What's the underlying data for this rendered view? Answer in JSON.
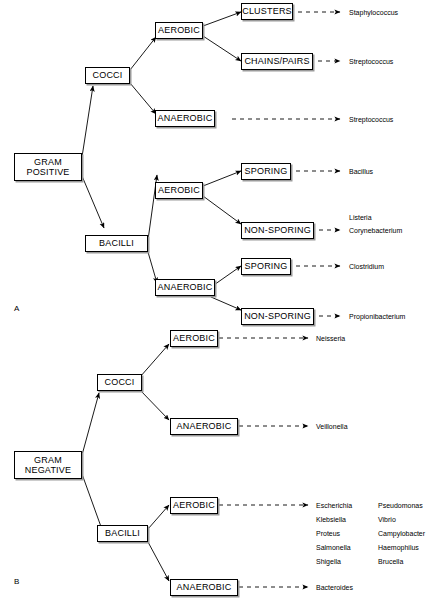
{
  "figure": {
    "panels": [
      {
        "id": "A",
        "label": "A",
        "root": "GRAM\nPOSITIVE"
      },
      {
        "id": "B",
        "label": "B",
        "root": "GRAM\nNEGATIVE"
      }
    ]
  },
  "panel_a": {
    "root_label": "GRAM\nPOSITIVE",
    "cocci_label": "COCCI",
    "bacilli_label": "BACILLI",
    "cocci_aerobic": "AEROBIC",
    "cocci_anaerobic": "ANAEROBIC",
    "clusters": "CLUSTERS",
    "chains_pairs": "CHAINS/PAIRS",
    "bacilli_aerobic": "AEROBIC",
    "bacilli_anaerobic": "ANAEROBIC",
    "aerobic_sporing": "SPORING",
    "aerobic_non_sporing": "NON-SPORING",
    "anaerobic_sporing": "SPORING",
    "anaerobic_non_sporing": "NON-SPORING",
    "organisms": {
      "clusters": "Staphylococcus",
      "chains_pairs": "Streptococcus",
      "cocci_anaerobic": "Streptococcus",
      "aerobic_sporing": "Bacillus",
      "aerobic_non_sporing_1": "Listeria",
      "aerobic_non_sporing_2": "Corynebacterium",
      "anaerobic_sporing": "Clostridium",
      "anaerobic_non_sporing": "Propionibacterium"
    }
  },
  "panel_b": {
    "root_label": "GRAM\nNEGATIVE",
    "cocci_label": "COCCI",
    "bacilli_label": "BACILLI",
    "cocci_aerobic": "AEROBIC",
    "cocci_anaerobic": "ANAEROBIC",
    "bacilli_aerobic": "AEROBIC",
    "bacilli_anaerobic": "ANAEROBIC",
    "organisms": {
      "cocci_aerobic": "Neisseria",
      "cocci_anaerobic": "Veillonella",
      "bacilli_anaerobic": "Bacteroides",
      "bacilli_aerobic_col1": [
        "Escherichia",
        "Klebsiella",
        "Proteus",
        "Salmonella",
        "Shigella"
      ],
      "bacilli_aerobic_col2": [
        "Pseudomonas",
        "Vibrio",
        "Campylobacter",
        "Haemophilus",
        "Brucella"
      ]
    }
  },
  "style": {
    "line_color": "#000000",
    "shadow_color": "#9a9a9a",
    "background": "#ffffff"
  }
}
